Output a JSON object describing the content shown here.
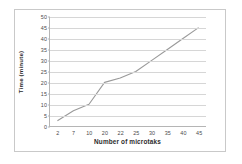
{
  "chart_data": {
    "type": "line",
    "title": "",
    "xlabel": "Number of microtaks",
    "ylabel": "Time (minute)",
    "categories": [
      "2",
      "7",
      "10",
      "20",
      "22",
      "25",
      "30",
      "35",
      "40",
      "45"
    ],
    "values": [
      2.5,
      7,
      10,
      20,
      22,
      25,
      30,
      35,
      40,
      45
    ],
    "series": [
      {
        "name": "Time",
        "values": [
          2.5,
          7,
          10,
          20,
          22,
          25,
          30,
          35,
          40,
          45
        ]
      }
    ],
    "ylim": [
      0,
      50
    ],
    "yticks": [
      0,
      5,
      10,
      15,
      20,
      25,
      30,
      35,
      40,
      45,
      50
    ],
    "ytick_labels": [
      "0",
      "5",
      "10",
      "15",
      "20",
      "25",
      "30",
      "35",
      "40",
      "45",
      "50"
    ],
    "xtick_labels": [
      "2",
      "7",
      "10",
      "20",
      "22",
      "25",
      "30",
      "35",
      "40",
      "45"
    ],
    "grid": true,
    "grid_axis": "y",
    "legend": false,
    "legend_position": "none",
    "line_color": "#9a9a9a",
    "grid_color": "#d6d6d6",
    "axis_color": "#b5b5b5",
    "background_color": "#ffffff",
    "text_color": "#4a4a4a"
  }
}
